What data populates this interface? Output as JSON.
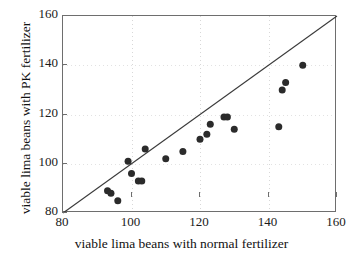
{
  "chart_data": {
    "type": "scatter",
    "title": "",
    "xlabel": "viable lima beans with normal fertilizer",
    "ylabel": "viable lima beans with PK fertilizer",
    "xlim": [
      80,
      160
    ],
    "ylim": [
      80,
      160
    ],
    "xticks": [
      80,
      100,
      120,
      140,
      160
    ],
    "yticks": [
      80,
      100,
      120,
      140,
      160
    ],
    "xtick_labels": [
      "80",
      "100",
      "120",
      "140",
      "160"
    ],
    "ytick_labels": [
      "80",
      "100",
      "120",
      "140",
      "160"
    ],
    "grid": true,
    "legend": null,
    "marker": "filled-circle",
    "marker_color": "#2b2b2b",
    "annotations": [
      {
        "kind": "reference-line",
        "label": "y = x identity line",
        "from": [
          80,
          80
        ],
        "to": [
          160,
          160
        ],
        "color": "#3a3a3a"
      }
    ],
    "points": [
      {
        "x": 93,
        "y": 89
      },
      {
        "x": 94,
        "y": 88
      },
      {
        "x": 96,
        "y": 85
      },
      {
        "x": 99,
        "y": 101
      },
      {
        "x": 100,
        "y": 96
      },
      {
        "x": 102,
        "y": 93
      },
      {
        "x": 103,
        "y": 93
      },
      {
        "x": 104,
        "y": 106
      },
      {
        "x": 110,
        "y": 102
      },
      {
        "x": 115,
        "y": 105
      },
      {
        "x": 120,
        "y": 110
      },
      {
        "x": 122,
        "y": 112
      },
      {
        "x": 123,
        "y": 116
      },
      {
        "x": 127,
        "y": 119
      },
      {
        "x": 128,
        "y": 119
      },
      {
        "x": 130,
        "y": 114
      },
      {
        "x": 143,
        "y": 115
      },
      {
        "x": 144,
        "y": 130
      },
      {
        "x": 145,
        "y": 133
      },
      {
        "x": 150,
        "y": 140
      }
    ]
  }
}
